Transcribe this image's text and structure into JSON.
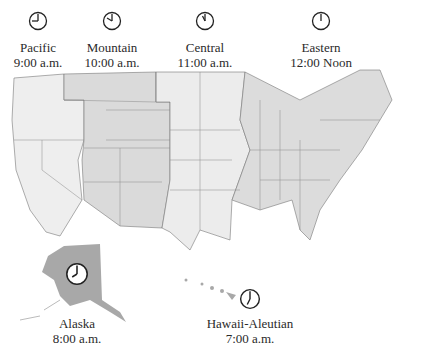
{
  "zones": [
    {
      "name": "Pacific",
      "time": "9:00 a.m.",
      "hour": 9,
      "minute": 0
    },
    {
      "name": "Mountain",
      "time": "10:00 a.m.",
      "hour": 10,
      "minute": 0
    },
    {
      "name": "Central",
      "time": "11:00 a.m.",
      "hour": 11,
      "minute": 0
    },
    {
      "name": "Eastern",
      "time": "12:00 Noon",
      "hour": 12,
      "minute": 0
    },
    {
      "name": "Alaska",
      "time": "8:00 a.m.",
      "hour": 8,
      "minute": 0
    },
    {
      "name": "Hawaii-Aleutian",
      "time": "7:00 a.m.",
      "hour": 7,
      "minute": 0
    }
  ],
  "colors": {
    "pacific": "#eeeeee",
    "mountain": "#d9d9d9",
    "central": "#ececec",
    "eastern": "#dcdcdc",
    "alaska": "#a8a8a8",
    "hawaii": "#a8a8a8",
    "border": "#777777",
    "clock": "#222222"
  }
}
